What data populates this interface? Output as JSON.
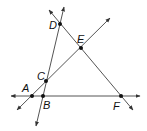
{
  "diagram": {
    "title": "",
    "line_color": "#555555",
    "point_color": "#111111",
    "points": [
      {
        "id": "A",
        "label": "A",
        "x": 32,
        "y": 96,
        "lx": 22,
        "ly": 92
      },
      {
        "id": "B",
        "label": "B",
        "x": 43,
        "y": 96,
        "lx": 43,
        "ly": 109
      },
      {
        "id": "C",
        "label": "C",
        "x": 46,
        "y": 81,
        "lx": 37,
        "ly": 80
      },
      {
        "id": "D",
        "label": "D",
        "x": 60,
        "y": 24,
        "lx": 49,
        "ly": 29
      },
      {
        "id": "E",
        "label": "E",
        "x": 81,
        "y": 48,
        "lx": 77,
        "ly": 43
      },
      {
        "id": "F",
        "label": "F",
        "x": 121,
        "y": 96,
        "lx": 113,
        "ly": 110
      }
    ],
    "lines": [
      {
        "id": "line-AF",
        "x1": 11,
        "y1": 96,
        "x2": 140,
        "y2": 96,
        "arrows": "both"
      },
      {
        "id": "line-AE",
        "x1": 17,
        "y1": 110,
        "x2": 110,
        "y2": 18,
        "arrows": "both"
      },
      {
        "id": "line-DB",
        "x1": 64,
        "y1": 7,
        "x2": 36,
        "y2": 126,
        "arrows": "both"
      },
      {
        "id": "line-DF",
        "x1": 49,
        "y1": 10,
        "x2": 133,
        "y2": 110,
        "arrows": "both"
      }
    ]
  }
}
